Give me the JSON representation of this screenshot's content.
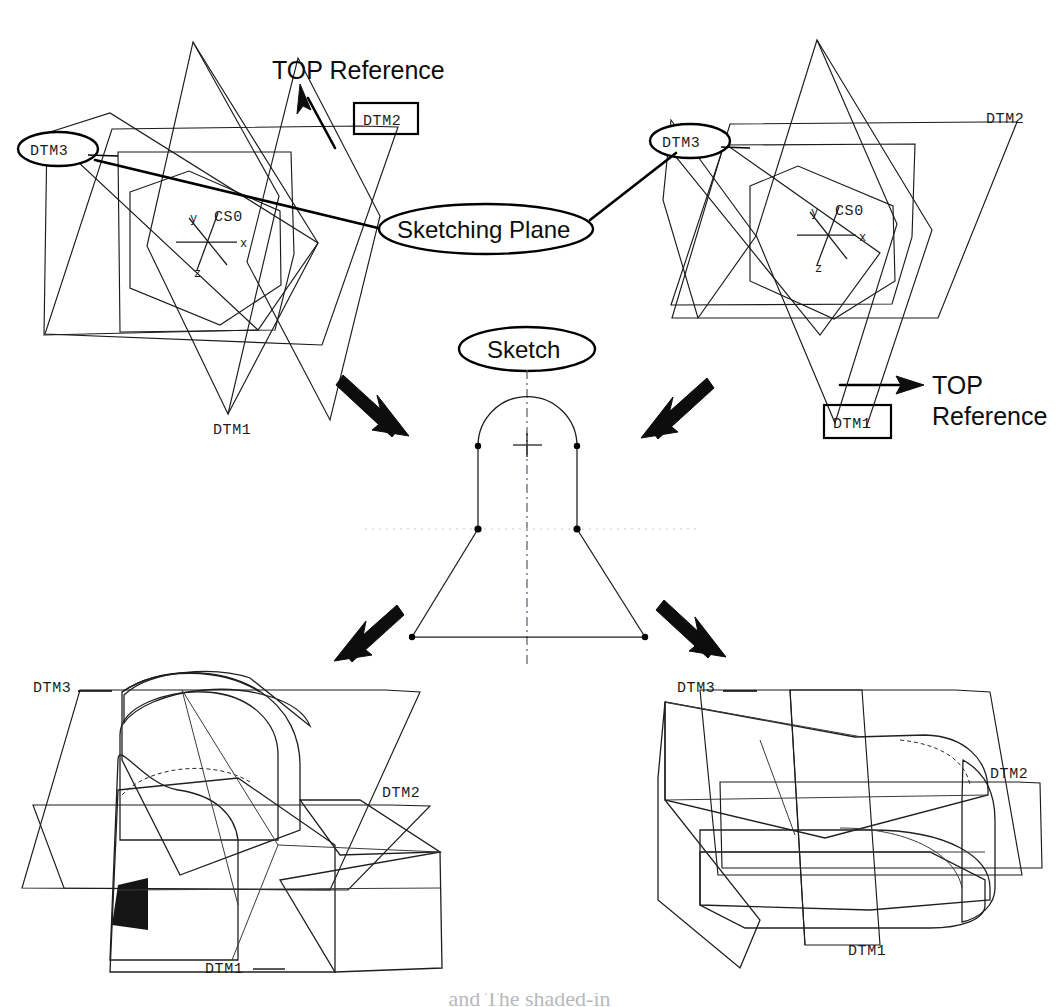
{
  "figure": {
    "line_color": "#1b1b1b",
    "background": "#ffffff"
  },
  "panels": {
    "top_left": {
      "name": "Left datum set",
      "balloon_dtm3": "DTM3",
      "box_dtm2": "DTM2",
      "label_dtm1": "DTM1",
      "top_reference": "TOP Reference",
      "cs_name": "CS0",
      "axis_x": "x",
      "axis_y": "y",
      "axis_z": "z"
    },
    "top_right": {
      "name": "Right datum set",
      "balloon_dtm3": "DTM3",
      "label_dtm2": "DTM2",
      "box_dtm1": "DTM1",
      "top_reference_line1": "TOP",
      "top_reference_line2": "Reference",
      "cs_name": "CS0",
      "axis_x": "x",
      "axis_y": "y",
      "axis_z": "z"
    },
    "center": {
      "name": "Shared sketch section",
      "balloon_sketch": "Sketch",
      "balloon_sketching_plane": "Sketching Plane"
    },
    "bottom_left": {
      "name": "Resulting solid, left orientation",
      "label_dtm3": "DTM3",
      "label_dtm2": "DTM2",
      "label_dtm1": "DTM1"
    },
    "bottom_right": {
      "name": "Resulting solid, right orientation",
      "label_dtm3": "DTM3",
      "label_dtm2": "DTM2",
      "label_dtm1": "DTM1"
    }
  },
  "arrows": [
    {
      "id": "top-reference-arrow-left",
      "label": "TOP Reference",
      "direction": "up-left"
    },
    {
      "id": "top-reference-arrow-right",
      "label": "TOP Reference",
      "direction": "right"
    },
    {
      "id": "sketch-arrow-upper-left",
      "label": "",
      "direction": "down-right"
    },
    {
      "id": "sketch-arrow-upper-right",
      "label": "",
      "direction": "down-left"
    },
    {
      "id": "sketch-arrow-lower-left",
      "label": "",
      "direction": "down-left"
    },
    {
      "id": "sketch-arrow-lower-right",
      "label": "",
      "direction": "down-right"
    }
  ],
  "shading": {
    "solid_dark": "#8e8e8e",
    "solid_mid": "#a2a2a2",
    "solid_light": "#c9c9c9",
    "solid_pale": "#d9d9d9",
    "solid_shadow": "#151515"
  },
  "footer": {
    "cut_off_caption": "and The shaded-in"
  }
}
